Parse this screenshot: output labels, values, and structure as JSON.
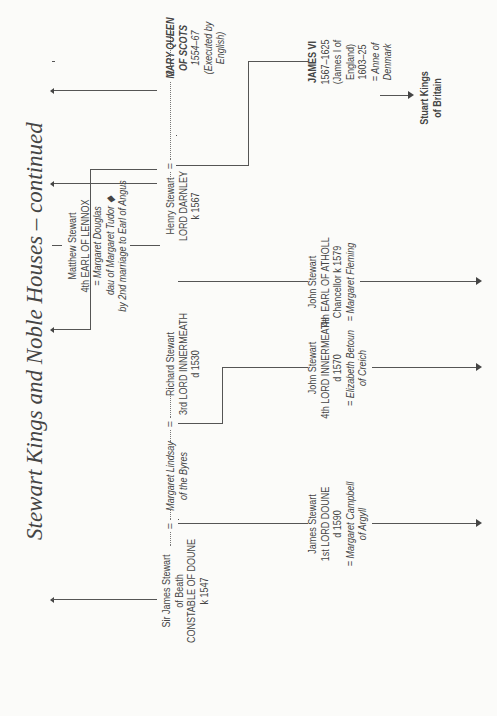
{
  "title": "Stewart Kings and Noble Houses – continued",
  "people": {
    "james_beath": {
      "l1": "Sir James Stewart",
      "l2": "of Beath",
      "l3": "CONSTABLE OF DOUNE",
      "l4": "k 1547"
    },
    "margaret_lindsay": {
      "l1": "Margaret Lindsay",
      "l2": "of the Byres"
    },
    "richard": {
      "l1": "Richard Stewart",
      "l2": "3rd LORD INNERMEATH",
      "l3": "d 1530"
    },
    "matthew": {
      "l1": "Matthew Stewart",
      "l2": "4th EARL OF LENNOX",
      "l3": "= Margaret Douglas",
      "l4": "dau of Margaret  Tudor ◆",
      "l5": "by 2nd marriage to Earl of Angus"
    },
    "darnley": {
      "l1": "Henry Stewart",
      "l2": "LORD DARNLEY",
      "l3": "k 1567"
    },
    "mary": {
      "l1": "MARY QUEEN",
      "l2": "OF SCOTS",
      "l3": "1554–67",
      "l4": "(Executed by",
      "l5": "English)"
    },
    "james_doune": {
      "l1": "James Stewart",
      "l2": "1st LORD DOUNE",
      "l3": "d 1590",
      "l4": "= Margaret Campbell",
      "l5": "of Argyll"
    },
    "john_innermeath": {
      "l1": "John Stewart",
      "l2": "4th LORD INNERMEATH",
      "l3": "d 1570",
      "l4": "= Elizabeth Betoun",
      "l5": "of Creich"
    },
    "john_atholl": {
      "l1": "John Stewart",
      "l2": "4th EARL OF ATHOLL",
      "l3": "Chancellor k 1579",
      "l4": "= Margaret  Fleming"
    },
    "james_vi": {
      "l1": "JAMES VI",
      "l2": "1567–1625",
      "l3": "(James I of",
      "l4": "England)",
      "l5": "1603–25",
      "l6": "= Anne of",
      "l7": "Denmark"
    },
    "stuart_kings": {
      "l1": "Stuart Kings",
      "l2": "of Britain"
    }
  },
  "connectors": {
    "marriage_symbol": "=",
    "second_marriage_symbol": "2"
  }
}
